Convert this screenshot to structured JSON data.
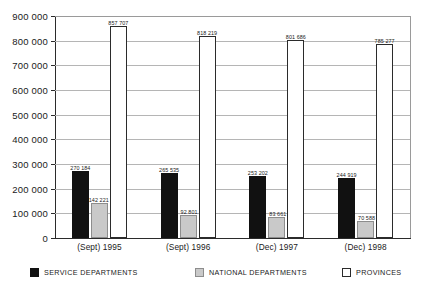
{
  "chart_data": {
    "type": "bar",
    "title": "",
    "xlabel": "",
    "ylabel": "",
    "ylim": [
      0,
      900000
    ],
    "grid": true,
    "legend_position": "bottom",
    "categories": [
      "(Sept) 1995",
      "(Sept) 1996",
      "(Dec) 1997",
      "(Dec) 1998"
    ],
    "yticks": [
      "0",
      "100 000",
      "200 000",
      "300 000",
      "400 000",
      "500 000",
      "600 000",
      "700 000",
      "800 000",
      "900 000"
    ],
    "ytick_values": [
      0,
      100000,
      200000,
      300000,
      400000,
      500000,
      600000,
      700000,
      800000,
      900000
    ],
    "series": [
      {
        "name": "SERVICE DEPARTMENTS",
        "color": "#111111",
        "values": [
          270184,
          265535,
          253202,
          244919
        ],
        "labels": [
          "270 184",
          "265 535",
          "253 202",
          "244 919"
        ]
      },
      {
        "name": "NATIONAL DEPARTMENTS",
        "color": "#c9c9c9",
        "values": [
          142221,
          92801,
          83661,
          70588
        ],
        "labels": [
          "142 221",
          "92 801",
          "83 661",
          "70 588"
        ]
      },
      {
        "name": "PROVINCES",
        "color": "#ffffff",
        "values": [
          857707,
          818219,
          801686,
          785277
        ],
        "labels": [
          "857 707",
          "818 219",
          "801 686",
          "785 277"
        ]
      }
    ]
  }
}
